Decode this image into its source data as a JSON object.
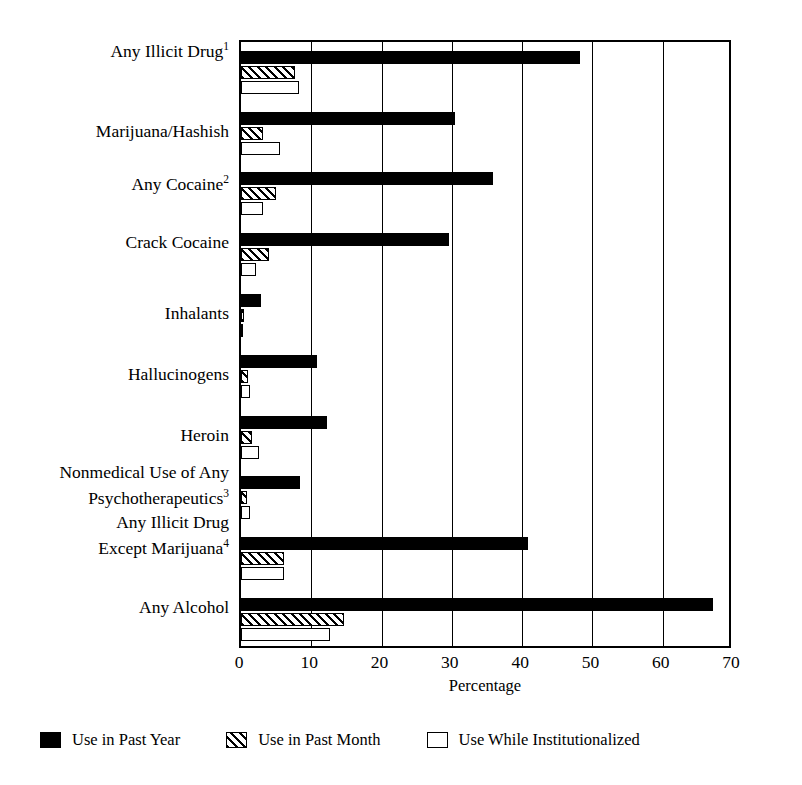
{
  "chart_data": {
    "type": "bar",
    "orientation": "horizontal",
    "title": "",
    "xlabel": "Percentage",
    "ylabel": "",
    "xlim": [
      0,
      70
    ],
    "xticks": [
      0,
      10,
      20,
      30,
      40,
      50,
      60,
      70
    ],
    "grid": "vertical",
    "legend_position": "bottom",
    "categories": [
      "Any Illicit Drug",
      "Marijuana/Hashish",
      "Any Cocaine",
      "Crack Cocaine",
      "Inhalants",
      "Hallucinogens",
      "Heroin",
      "Nonmedical Use of Any\nPsychotherapeutics",
      "Any Illicit Drug\nExcept Marijuana",
      "Any Alcohol"
    ],
    "category_footnotes": [
      "1",
      "",
      "2",
      "",
      "",
      "",
      "",
      "3",
      "4",
      ""
    ],
    "series": [
      {
        "name": "Use in Past Year",
        "style": "solid-black",
        "color": "#000000",
        "values": [
          48.2,
          30.4,
          35.8,
          29.6,
          2.8,
          10.8,
          12.2,
          8.4,
          40.8,
          67.2
        ]
      },
      {
        "name": "Use in Past Month",
        "style": "hatched",
        "color": "#000000",
        "values": [
          7.7,
          3.2,
          5.0,
          4.0,
          0.4,
          1.0,
          1.6,
          0.9,
          6.1,
          14.7
        ]
      },
      {
        "name": "Use While Institutionalized",
        "style": "white-outline",
        "color": "#ffffff",
        "values": [
          8.2,
          5.6,
          3.1,
          2.2,
          0.3,
          1.3,
          2.6,
          1.3,
          6.1,
          12.6
        ]
      }
    ]
  },
  "legend": {
    "items": [
      {
        "label": "Use in Past Year",
        "swatch": "year"
      },
      {
        "label": "Use in Past Month",
        "swatch": "month"
      },
      {
        "label": "Use While Institutionalized",
        "swatch": "inst"
      }
    ]
  }
}
